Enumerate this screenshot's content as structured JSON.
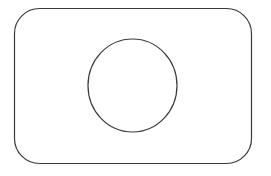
{
  "canvas": {
    "width": 271,
    "height": 176,
    "background": "#ffffff"
  },
  "shapes": {
    "rounded_rect": {
      "x": 14.5,
      "y": 8.5,
      "width": 237,
      "height": 155,
      "rx": 25,
      "stroke": "#3a3a3a",
      "stroke_width": 1.2,
      "fill": "none"
    },
    "circle": {
      "cx": 132.5,
      "cy": 85.5,
      "rx": 44.5,
      "ry": 46.5,
      "stroke": "#3a3a3a",
      "stroke_width": 1.2,
      "fill": "none"
    }
  }
}
